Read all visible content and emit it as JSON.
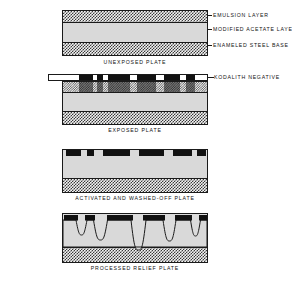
{
  "figure": {
    "background": "#ffffff",
    "ink": "#1a1a1a",
    "acetate_color": "#d9d9d9",
    "emulsion_color": "#111111"
  },
  "panels": [
    {
      "id": "unexposed",
      "caption": "UNEXPOSED PLATE",
      "layers": [
        {
          "name": "emulsion-layer",
          "label": "EMULSION LAYER",
          "fill": "hatch"
        },
        {
          "name": "modified-acetate-layer",
          "label": "MODIFIED ACETATE LAYER",
          "fill": "solid-gray"
        },
        {
          "name": "enameled-steel-base",
          "label": "ENAMELED STEEL BASE",
          "fill": "hatch"
        }
      ],
      "callouts": [
        "EMULSION LAYER",
        "MODIFIED ACETATE LAYER",
        "ENAMELED STEEL BASE"
      ]
    },
    {
      "id": "exposed",
      "caption": "EXPOSED PLATE",
      "negative_label": "KODALITH NEGATIVE",
      "negative_segments": [
        {
          "x": 16.5,
          "w": 14.5
        },
        {
          "x": 35.0,
          "w": 6.0
        },
        {
          "x": 45.5,
          "w": 22.0
        },
        {
          "x": 75.0,
          "w": 18.5
        },
        {
          "x": 101.5,
          "w": 16.0
        },
        {
          "x": 124.0,
          "w": 9.0
        }
      ]
    },
    {
      "id": "washed-off",
      "caption": "ACTIVATED AND WASHED-OFF PLATE",
      "emulsion_blocks": [
        {
          "x": 3.0,
          "w": 15.0
        },
        {
          "x": 24.0,
          "w": 7.0
        },
        {
          "x": 40.0,
          "w": 27.0
        },
        {
          "x": 76.0,
          "w": 25.0
        },
        {
          "x": 110.0,
          "w": 19.0
        },
        {
          "x": 134.0,
          "w": 9.0
        }
      ]
    },
    {
      "id": "relief",
      "caption": "PROCESSED RELIEF PLATE",
      "emulsion_blocks": [
        {
          "x": 1.0,
          "w": 14.0
        },
        {
          "x": 22.0,
          "w": 10.0
        },
        {
          "x": 44.0,
          "w": 26.0
        },
        {
          "x": 80.0,
          "w": 22.0
        },
        {
          "x": 112.0,
          "w": 17.0
        },
        {
          "x": 136.0,
          "w": 8.0
        }
      ],
      "etch_valleys": [
        {
          "center": 18.5,
          "width": 9.0,
          "depth": 15.0
        },
        {
          "center": 37.5,
          "width": 12.0,
          "depth": 20.0
        },
        {
          "center": 75.5,
          "width": 13.0,
          "depth": 30.0
        },
        {
          "center": 106.5,
          "width": 11.0,
          "depth": 21.0
        },
        {
          "center": 132.5,
          "width": 8.0,
          "depth": 16.0
        }
      ]
    }
  ]
}
